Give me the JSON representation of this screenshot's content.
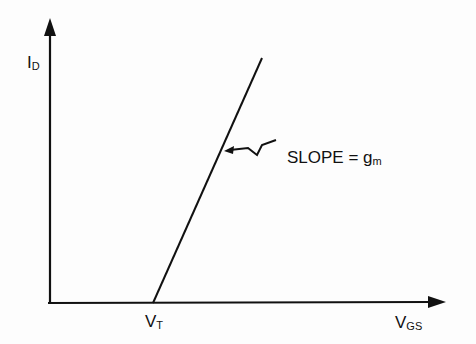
{
  "diagram": {
    "y_axis_label": {
      "main": "I",
      "sub": "D"
    },
    "x_axis_label": {
      "main": "V",
      "sub": "GS"
    },
    "threshold_label": {
      "main": "V",
      "sub": "T"
    },
    "annotation": {
      "text": "SLOPE = g",
      "sub": "m"
    },
    "line": {
      "from": [
        153,
        303
      ],
      "to": [
        262,
        58
      ]
    },
    "colors": {
      "stroke": "#111111",
      "background": "#fdfdfd"
    }
  }
}
